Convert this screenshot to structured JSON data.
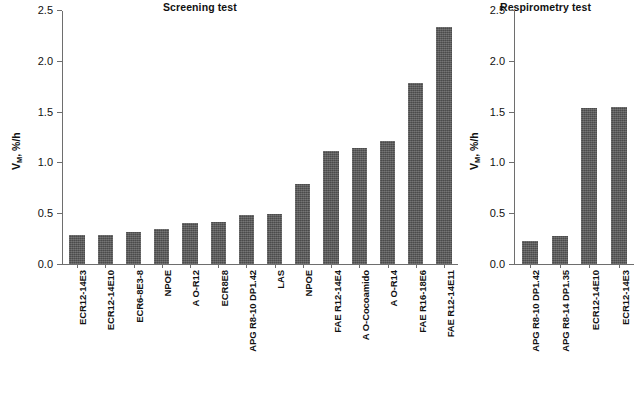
{
  "figure": {
    "background": "#ffffff",
    "bar_color": "#595959",
    "axis_color": "#6e6e6e"
  },
  "chart_data": [
    {
      "type": "bar",
      "title": "Screening test",
      "xlabel": "",
      "ylabel": "Vₘ, %/h",
      "ylabel_base": "V",
      "ylabel_sub": "M",
      "ylabel_tail": ", %/h",
      "ylim": [
        0,
        2.5
      ],
      "yticks": [
        0.0,
        0.5,
        1.0,
        1.5,
        2.0,
        2.5
      ],
      "ytick_labels": [
        "0.0",
        "0.5",
        "1.0",
        "1.5",
        "2.0",
        "2.5"
      ],
      "grid": false,
      "legend": null,
      "categories": [
        "ECR12-14E3",
        "ECR12-14E10",
        "ECR6-8E3-8",
        "NPOE",
        "A O-R12",
        "ECR8E8",
        "APG R8-10 DP1.42",
        "LAS",
        "NPOE",
        "FAE R12-14E4",
        "A O-Cocoamido",
        "A O-R14",
        "FAE R16-18E6",
        "FAE R12-14E11"
      ],
      "values": [
        0.29,
        0.29,
        0.32,
        0.35,
        0.41,
        0.42,
        0.48,
        0.49,
        0.79,
        1.12,
        1.15,
        1.22,
        1.79,
        2.34
      ]
    },
    {
      "type": "bar",
      "title": "Respirometry test",
      "xlabel": "",
      "ylabel": "Vₘ, %/h",
      "ylabel_base": "V",
      "ylabel_sub": "M",
      "ylabel_tail": ", %/h",
      "ylim": [
        0,
        2.5
      ],
      "yticks": [
        0.0,
        0.5,
        1.0,
        1.5,
        2.0,
        2.5
      ],
      "ytick_labels": [
        "0.0",
        "0.5",
        "1.0",
        "1.5",
        "2.0",
        "2.5"
      ],
      "grid": false,
      "legend": null,
      "categories": [
        "APG R8-10 DP1.42",
        "APG R8-14 DP1.35",
        "ECR12-14E10",
        "ECR12-14E3"
      ],
      "values": [
        0.23,
        0.28,
        1.54,
        1.55
      ]
    }
  ]
}
